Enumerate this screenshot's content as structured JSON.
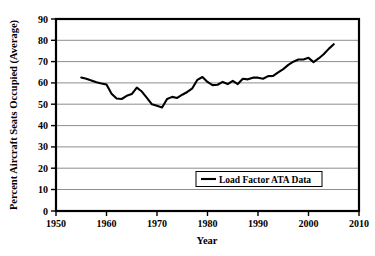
{
  "chart_data": {
    "type": "line",
    "title": "",
    "xlabel": "Year",
    "ylabel": "Percent Aircraft Seats Occupied (Average)",
    "xlim": [
      1950,
      2010
    ],
    "ylim": [
      0,
      90
    ],
    "xticks": [
      1950,
      1960,
      1970,
      1980,
      1990,
      2000,
      2010
    ],
    "yticks": [
      0,
      10,
      20,
      30,
      40,
      50,
      60,
      70,
      80,
      90
    ],
    "grid": "horizontal",
    "legend_position": "inside-lower-right",
    "series": [
      {
        "name": "Load Factor ATA Data",
        "color": "#000000",
        "x": [
          1955,
          1956,
          1957,
          1958,
          1959,
          1960,
          1961,
          1962,
          1963,
          1964,
          1965,
          1966,
          1967,
          1968,
          1969,
          1970,
          1971,
          1972,
          1973,
          1974,
          1975,
          1976,
          1977,
          1978,
          1979,
          1980,
          1981,
          1982,
          1983,
          1984,
          1985,
          1986,
          1987,
          1988,
          1989,
          1990,
          1991,
          1992,
          1993,
          1994,
          1995,
          1996,
          1997,
          1998,
          1999,
          2000,
          2001,
          2002,
          2003,
          2004,
          2005
        ],
        "values": [
          62.6,
          62.0,
          61.2,
          60.4,
          59.8,
          59.3,
          55.0,
          52.7,
          52.5,
          54.0,
          54.8,
          57.8,
          56.0,
          53.0,
          50.0,
          49.3,
          48.5,
          52.5,
          53.5,
          53.0,
          54.5,
          55.8,
          57.5,
          61.5,
          62.8,
          60.5,
          59.0,
          59.2,
          60.5,
          59.5,
          61.0,
          59.5,
          62.0,
          61.7,
          62.5,
          62.5,
          62.0,
          63.2,
          63.3,
          65.0,
          66.5,
          68.5,
          70.0,
          71.0,
          71.0,
          71.8,
          69.8,
          71.5,
          73.5,
          76.0,
          78.2
        ]
      }
    ]
  },
  "axis": {
    "y_label": "Percent Aircraft Seats Occupied (Average)",
    "x_label": "Year",
    "y_ticks": [
      "0",
      "10",
      "20",
      "30",
      "40",
      "50",
      "60",
      "70",
      "80",
      "90"
    ],
    "x_ticks": [
      "1950",
      "1960",
      "1970",
      "1980",
      "1990",
      "2000",
      "2010"
    ]
  },
  "legend": {
    "entries": [
      {
        "label": "Load Factor ATA Data",
        "color": "#000000"
      }
    ]
  },
  "colors": {
    "line": "#000000",
    "grid": "#808080",
    "frame": "#000000",
    "background": "#ffffff"
  }
}
